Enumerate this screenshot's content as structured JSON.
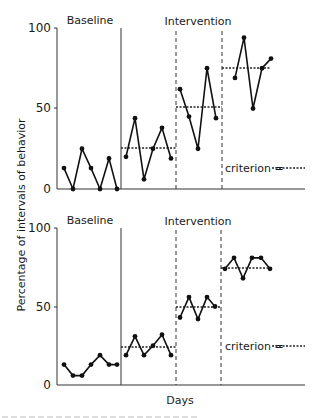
{
  "chart_data": [
    {
      "type": "line",
      "panel": "top",
      "ylabel": "Percentage of intervals of behavior",
      "xlabel": "",
      "ylim": [
        0,
        100
      ],
      "yticks": [
        "0",
        "50",
        "100"
      ],
      "grid": false,
      "phase_labels": [
        "Baseline",
        "Intervention"
      ],
      "legend": "criterion = ",
      "phases": [
        {
          "name": "Baseline",
          "values": [
            13,
            0,
            25,
            13,
            0,
            19,
            0
          ],
          "criterion": null
        },
        {
          "name": "Intervention 1",
          "values": [
            20,
            44,
            6,
            25,
            38,
            19
          ],
          "criterion": 25
        },
        {
          "name": "Intervention 2",
          "values": [
            62,
            45,
            25,
            75,
            44
          ],
          "criterion": 50
        },
        {
          "name": "Intervention 3",
          "values": [
            69,
            94,
            50,
            75,
            81
          ],
          "criterion": 75
        }
      ]
    },
    {
      "type": "line",
      "panel": "bottom",
      "ylabel": "Percentage of intervals of behavior",
      "xlabel": "Days",
      "ylim": [
        0,
        100
      ],
      "yticks": [
        "0",
        "50",
        "100"
      ],
      "grid": false,
      "phase_labels": [
        "Baseline",
        "Intervention"
      ],
      "legend": "criterion = ",
      "phases": [
        {
          "name": "Baseline",
          "values": [
            13,
            6,
            6,
            13,
            19,
            13,
            13
          ],
          "criterion": null
        },
        {
          "name": "Intervention 1",
          "values": [
            19,
            31,
            19,
            25,
            32,
            19
          ],
          "criterion": 24
        },
        {
          "name": "Intervention 2",
          "values": [
            43,
            56,
            42,
            56,
            50
          ],
          "criterion": 50
        },
        {
          "name": "Intervention 3",
          "values": [
            74,
            81,
            68,
            81,
            81,
            74
          ],
          "criterion": 75
        }
      ]
    }
  ],
  "labels": {
    "baseline": "Baseline",
    "intervention": "Intervention",
    "criterion": "criterion =",
    "ylabel": "Percentage of intervals of behavior",
    "xlabel": "Days",
    "tick_0": "0",
    "tick_50": "50",
    "tick_100": "100"
  }
}
